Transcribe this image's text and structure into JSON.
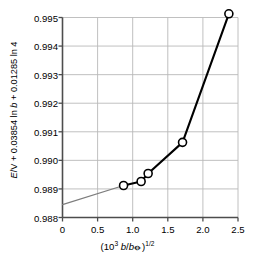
{
  "chart_data": {
    "type": "line",
    "title": "",
    "xlabel": "(10^3 b/b⦵)^(1/2)",
    "ylabel": "E/V + 0.03854 ln b + 0.01285 ln 4",
    "xlabel_parts": {
      "open": "(10",
      "exp": "3",
      "space": " ",
      "num": "b",
      "slash": "/",
      "den": "b",
      "standard_state": "⦵",
      "close": ")",
      "power": "1/2"
    },
    "ylabel_parts": {
      "e": "E",
      "over_v": "/V + 0.03854 ln ",
      "b": "b",
      "tail": " + 0.01285 ln 4"
    },
    "xlim": [
      0,
      2.5
    ],
    "ylim": [
      0.988,
      0.995
    ],
    "xticks": [
      0,
      0.5,
      1.0,
      1.5,
      2.0,
      2.5
    ],
    "xticklabels": [
      "0",
      "0.5",
      "1.0",
      "1.5",
      "2.0",
      "2.5"
    ],
    "yticks": [
      0.988,
      0.989,
      0.99,
      0.991,
      0.992,
      0.993,
      0.994,
      0.995
    ],
    "yticklabels": [
      "0.988",
      "0.989",
      "0.990",
      "0.991",
      "0.992",
      "0.993",
      "0.994",
      "0.995"
    ],
    "grid": true,
    "grid_color": "#b9b9b9",
    "axis_color": "#4d4d4d",
    "legend": "none",
    "series": [
      {
        "name": "measured",
        "marker": "open-circle",
        "marker_face": "#ffffff",
        "marker_edge": "#000000",
        "line_color": "#000000",
        "x": [
          0.87,
          1.12,
          1.22,
          1.71,
          2.37
        ],
        "y": [
          0.98912,
          0.98926,
          0.98954,
          0.99063,
          0.99513
        ]
      },
      {
        "name": "extrapolation-to-intercept",
        "marker": "none",
        "line_color": "#7d7d7d",
        "x": [
          0.0,
          0.87
        ],
        "y": [
          0.98845,
          0.98912
        ]
      }
    ],
    "intercept": 0.98845
  }
}
